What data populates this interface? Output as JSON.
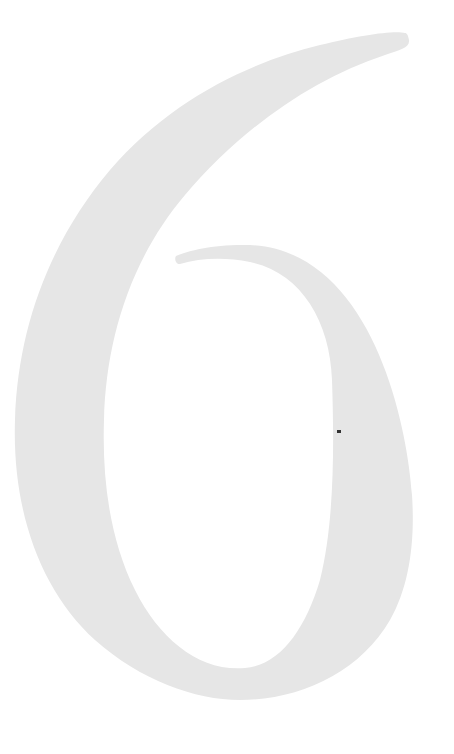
{
  "page": {
    "chapter_numeral": "6",
    "numeral_color": "#e6e6e6",
    "background_color": "#ffffff"
  }
}
